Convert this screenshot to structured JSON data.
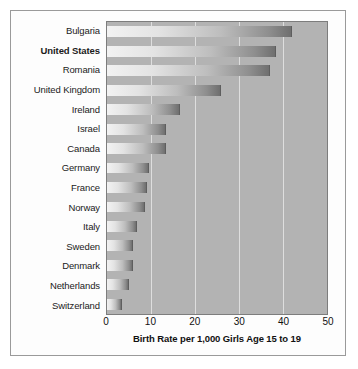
{
  "chart_data": {
    "type": "bar",
    "orientation": "horizontal",
    "title": "",
    "xlabel": "Birth Rate per 1,000 Girls Age 15 to 19",
    "ylabel": "",
    "xlim": [
      0,
      50
    ],
    "xticks": [
      0,
      10,
      20,
      30,
      40,
      50
    ],
    "xtick_labels": [
      "0",
      "10",
      "20",
      "30",
      "40",
      "50"
    ],
    "grid": true,
    "grid_axis": "x",
    "legend": "none",
    "highlighted_category": "United States",
    "categories": [
      "Bulgaria",
      "United States",
      "Romania",
      "United Kingdom",
      "Ireland",
      "Israel",
      "Canada",
      "Germany",
      "France",
      "Norway",
      "Italy",
      "Sweden",
      "Denmark",
      "Netherlands",
      "Switzerland"
    ],
    "values": [
      42,
      38.5,
      37,
      26,
      16.5,
      13.5,
      13.5,
      9.5,
      9,
      8.7,
      6.8,
      5.8,
      5.8,
      5,
      3.5
    ],
    "bars": [
      {
        "label": "Bulgaria",
        "value": 42,
        "bold": false
      },
      {
        "label": "United States",
        "value": 38.5,
        "bold": true
      },
      {
        "label": "Romania",
        "value": 37,
        "bold": false
      },
      {
        "label": "United Kingdom",
        "value": 26,
        "bold": false
      },
      {
        "label": "Ireland",
        "value": 16.5,
        "bold": false
      },
      {
        "label": "Israel",
        "value": 13.5,
        "bold": false
      },
      {
        "label": "Canada",
        "value": 13.5,
        "bold": false
      },
      {
        "label": "Germany",
        "value": 9.5,
        "bold": false
      },
      {
        "label": "France",
        "value": 9,
        "bold": false
      },
      {
        "label": "Norway",
        "value": 8.7,
        "bold": false
      },
      {
        "label": "Italy",
        "value": 6.8,
        "bold": false
      },
      {
        "label": "Sweden",
        "value": 5.8,
        "bold": false
      },
      {
        "label": "Denmark",
        "value": 5.8,
        "bold": false
      },
      {
        "label": "Netherlands",
        "value": 5,
        "bold": false
      },
      {
        "label": "Switzerland",
        "value": 3.5,
        "bold": false
      }
    ],
    "colors": {
      "plot_background": "#b3b3b3",
      "gridline": "#dedede",
      "bar_light": "#f2f2f2",
      "bar_dark": "#6f6f6f",
      "border": "#7d7d7d",
      "figure_background": "#fdfdfd",
      "text": "#111111"
    }
  }
}
